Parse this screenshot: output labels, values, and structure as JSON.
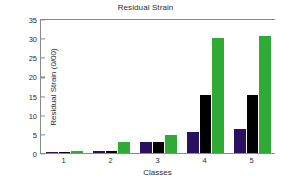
{
  "chart_data": {
    "type": "bar",
    "title": "Residual Strain",
    "xlabel": "Classes",
    "ylabel": "Residual Strain (0/00)",
    "categories": [
      "1",
      "2",
      "3",
      "4",
      "5"
    ],
    "yticks": [
      "0",
      "5",
      "10",
      "15",
      "20",
      "25",
      "30",
      "35"
    ],
    "ytick_values": [
      0,
      5,
      10,
      15,
      20,
      25,
      30,
      35
    ],
    "ylim": [
      0,
      35
    ],
    "grid": false,
    "legend": "none",
    "series": [
      {
        "name": "series-1",
        "color": "#2a1060",
        "values": [
          0.2,
          0.4,
          2.8,
          5.6,
          6.4
        ]
      },
      {
        "name": "series-2",
        "color": "#000000",
        "values": [
          0.25,
          0.5,
          2.8,
          15.1,
          15.1
        ]
      },
      {
        "name": "series-3",
        "color": "#2faa35",
        "values": [
          0.45,
          2.9,
          4.7,
          30.1,
          30.5
        ]
      }
    ]
  },
  "axis": {
    "frame_color": "#8a8a8a"
  }
}
